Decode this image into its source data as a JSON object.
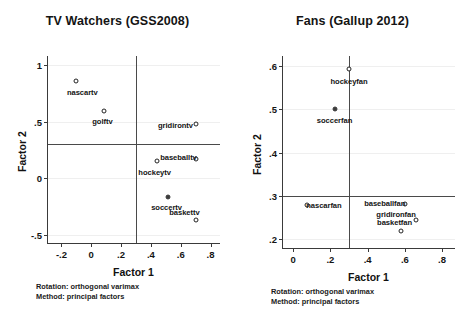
{
  "panels": [
    {
      "id": "tv-watchers",
      "title": "TV Watchers (GSS2008)",
      "xlabel": "Factor 1",
      "ylabel": "Factor 2",
      "footnote": "Rotation: orthogonal varimax\nMethod: principal factors",
      "xticks": [
        "-.2",
        "0",
        ".2",
        ".4",
        ".6",
        ".8"
      ],
      "xtickvals": [
        -0.2,
        0,
        0.2,
        0.4,
        0.6,
        0.8
      ],
      "yticks": [
        "1",
        ".5",
        "0",
        "-.5"
      ],
      "ytickvals": [
        1,
        0.5,
        0,
        -0.5
      ],
      "xlim": [
        -0.29,
        0.87
      ],
      "ylim": [
        -0.58,
        1.08
      ],
      "refline_x": 0.3,
      "refline_y": 0.3,
      "points": [
        {
          "label": "nascartv",
          "x": -0.105,
          "y": 0.855,
          "filled": false,
          "lx": -0.06,
          "ly": 0.765
        },
        {
          "label": "golftv",
          "x": 0.085,
          "y": 0.595,
          "filled": false,
          "lx": 0.075,
          "ly": 0.505
        },
        {
          "label": "gridirontv",
          "x": 0.7,
          "y": 0.48,
          "filled": false,
          "lx": 0.565,
          "ly": 0.47
        },
        {
          "label": "baseballtv",
          "x": 0.7,
          "y": 0.17,
          "filled": false,
          "lx": 0.585,
          "ly": 0.185
        },
        {
          "label": "hockeytv",
          "x": 0.44,
          "y": 0.15,
          "filled": false,
          "lx": 0.425,
          "ly": 0.06
        },
        {
          "label": "soccertv",
          "x": 0.515,
          "y": -0.165,
          "filled": true,
          "lx": 0.505,
          "ly": -0.25
        },
        {
          "label": "baskettv",
          "x": 0.7,
          "y": -0.37,
          "filled": false,
          "lx": 0.625,
          "ly": -0.295
        }
      ]
    },
    {
      "id": "fans",
      "title": "Fans (Gallup 2012)",
      "xlabel": "Factor 1",
      "ylabel": "Factor 2",
      "footnote": "Rotation: orthogonal varimax\nMethod: principal factors",
      "xticks": [
        "0",
        ".2",
        ".4",
        ".6",
        ".8"
      ],
      "xtickvals": [
        0,
        0.2,
        0.4,
        0.6,
        0.8
      ],
      "yticks": [
        ".6",
        ".5",
        ".4",
        ".3",
        ".2"
      ],
      "ytickvals": [
        0.6,
        0.5,
        0.4,
        0.3,
        0.2
      ],
      "xlim": [
        -0.055,
        0.875
      ],
      "ylim": [
        0.178,
        0.622
      ],
      "refline_x": 0.3,
      "refline_y": 0.3,
      "points": [
        {
          "label": "hockeyfan",
          "x": 0.3,
          "y": 0.592,
          "filled": false,
          "lx": 0.3,
          "ly": 0.565
        },
        {
          "label": "soccerfan",
          "x": 0.225,
          "y": 0.5,
          "filled": true,
          "lx": 0.222,
          "ly": 0.475
        },
        {
          "label": "nascarfan",
          "x": 0.075,
          "y": 0.28,
          "filled": false,
          "lx": 0.165,
          "ly": 0.279
        },
        {
          "label": "baseballfan",
          "x": 0.6,
          "y": 0.282,
          "filled": false,
          "lx": 0.492,
          "ly": 0.284
        },
        {
          "label": "gridironfan",
          "x": 0.66,
          "y": 0.245,
          "filled": false,
          "lx": 0.553,
          "ly": 0.259
        },
        {
          "label": "basketfan",
          "x": 0.58,
          "y": 0.22,
          "filled": false,
          "lx": 0.545,
          "ly": 0.24
        }
      ]
    }
  ],
  "chart_data": [
    {
      "type": "scatter",
      "title": "TV Watchers (GSS2008)",
      "xlabel": "Factor 1",
      "ylabel": "Factor 2",
      "xlim": [
        -0.29,
        0.87
      ],
      "ylim": [
        -0.58,
        1.08
      ],
      "xticks": [
        -0.2,
        0,
        0.2,
        0.4,
        0.6,
        0.8
      ],
      "yticks": [
        1,
        0.5,
        0,
        -0.5
      ],
      "grid": true,
      "legend": "none",
      "reference_lines": {
        "x": 0.3,
        "y": 0.3
      },
      "annotations": [
        "Rotation: orthogonal varimax",
        "Method: principal factors"
      ],
      "points": [
        {
          "label": "nascartv",
          "x": -0.11,
          "y": 0.86
        },
        {
          "label": "golftv",
          "x": 0.09,
          "y": 0.6
        },
        {
          "label": "gridirontv",
          "x": 0.7,
          "y": 0.48
        },
        {
          "label": "baseballtv",
          "x": 0.7,
          "y": 0.17
        },
        {
          "label": "hockeytv",
          "x": 0.44,
          "y": 0.15
        },
        {
          "label": "soccertv",
          "x": 0.52,
          "y": -0.17
        },
        {
          "label": "baskettv",
          "x": 0.7,
          "y": -0.37
        }
      ]
    },
    {
      "type": "scatter",
      "title": "Fans (Gallup 2012)",
      "xlabel": "Factor 1",
      "ylabel": "Factor 2",
      "xlim": [
        -0.055,
        0.875
      ],
      "ylim": [
        0.178,
        0.622
      ],
      "xticks": [
        0,
        0.2,
        0.4,
        0.6,
        0.8
      ],
      "yticks": [
        0.6,
        0.5,
        0.4,
        0.3,
        0.2
      ],
      "grid": true,
      "legend": "none",
      "reference_lines": {
        "x": 0.3,
        "y": 0.3
      },
      "annotations": [
        "Rotation: orthogonal varimax",
        "Method: principal factors"
      ],
      "points": [
        {
          "label": "hockeyfan",
          "x": 0.3,
          "y": 0.59
        },
        {
          "label": "soccerfan",
          "x": 0.225,
          "y": 0.5
        },
        {
          "label": "nascarfan",
          "x": 0.075,
          "y": 0.28
        },
        {
          "label": "baseballfan",
          "x": 0.6,
          "y": 0.28
        },
        {
          "label": "gridironfan",
          "x": 0.66,
          "y": 0.245
        },
        {
          "label": "basketfan",
          "x": 0.58,
          "y": 0.22
        }
      ]
    }
  ]
}
